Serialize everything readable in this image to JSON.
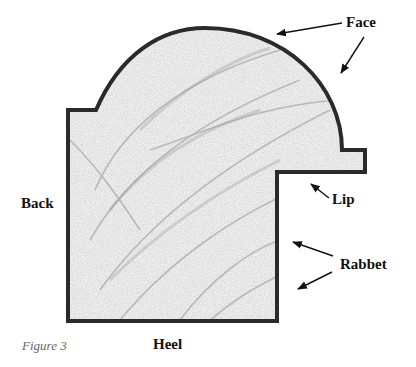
{
  "figure": {
    "caption": "Figure 3"
  },
  "labels": {
    "face": "Face",
    "back": "Back",
    "lip": "Lip",
    "rabbet": "Rabbet",
    "heel": "Heel"
  },
  "colors": {
    "outline": "#2a2a2a",
    "fill": "#f2f2f2",
    "grain": "#b5b5b5",
    "text": "#111111",
    "caption": "#666666"
  }
}
